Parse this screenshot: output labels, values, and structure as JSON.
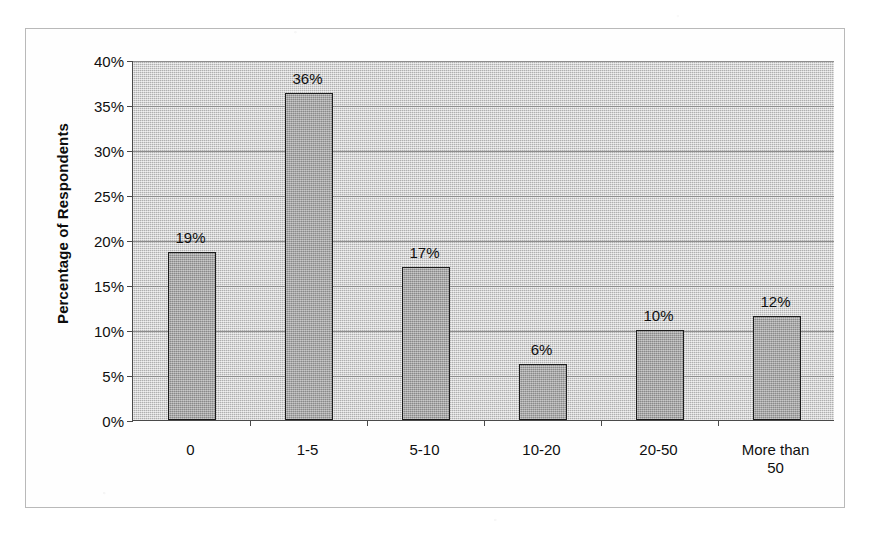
{
  "chart_data": {
    "type": "bar",
    "title": "",
    "xlabel": "",
    "ylabel": "Percentage of Respondents",
    "categories": [
      "0",
      "1-5",
      "5-10",
      "10-20",
      "20-50",
      "More than 50"
    ],
    "values": [
      18.7,
      36.3,
      17.0,
      6.2,
      10.0,
      11.6
    ],
    "data_labels": [
      "19%",
      "36%",
      "17%",
      "6%",
      "10%",
      "12%"
    ],
    "ylim": [
      0,
      40
    ],
    "ytick_labels": [
      "0%",
      "5%",
      "10%",
      "15%",
      "20%",
      "25%",
      "30%",
      "35%",
      "40%"
    ],
    "ytick_values": [
      0,
      5,
      10,
      15,
      20,
      25,
      30,
      35,
      40
    ],
    "grid": true,
    "legend": "none",
    "colors": {
      "bar_fill": "#9e9e9e",
      "bar_border": "#1b1b1b",
      "plot_background": "#c2c2c2",
      "gridline": "#8e8e8e",
      "axis": "#4a4a4a",
      "frame": "#b9b9b9",
      "text": "#0f0f0f"
    }
  }
}
